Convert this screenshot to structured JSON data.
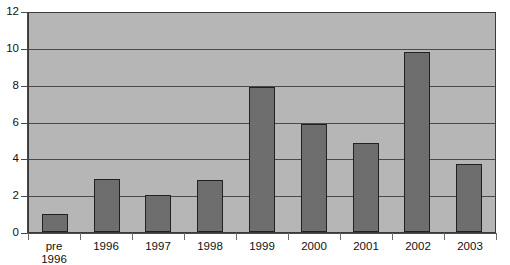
{
  "chart_data": {
    "type": "bar",
    "title": "",
    "subtitle": "",
    "xlabel": "",
    "ylabel": "",
    "categories": [
      "pre\n1996",
      "1996",
      "1997",
      "1998",
      "1999",
      "2000",
      "2001",
      "2002",
      "2003"
    ],
    "values": [
      1.0,
      2.9,
      2.0,
      2.85,
      7.9,
      5.85,
      4.85,
      9.75,
      3.7
    ],
    "series": [
      {
        "name": "",
        "values": [
          1.0,
          2.9,
          2.0,
          2.85,
          7.9,
          5.85,
          4.85,
          9.75,
          3.7
        ]
      }
    ],
    "ylim": [
      0,
      12
    ],
    "yticks": [
      0,
      2,
      4,
      6,
      8,
      10,
      12
    ],
    "ytick_labels": [
      "0",
      "2",
      "4",
      "6",
      "8",
      "10",
      "12"
    ],
    "grid": "horizontal",
    "legend": "none",
    "annotations": [],
    "colors": {
      "bar_fill": "#6e6e6e",
      "bar_stroke": "#212121",
      "plot_background": "#b6b6b6",
      "gridline": "#4a4a4a",
      "axis": "#4a4a4a",
      "text": "#111111",
      "figure_background": "#ffffff"
    }
  }
}
